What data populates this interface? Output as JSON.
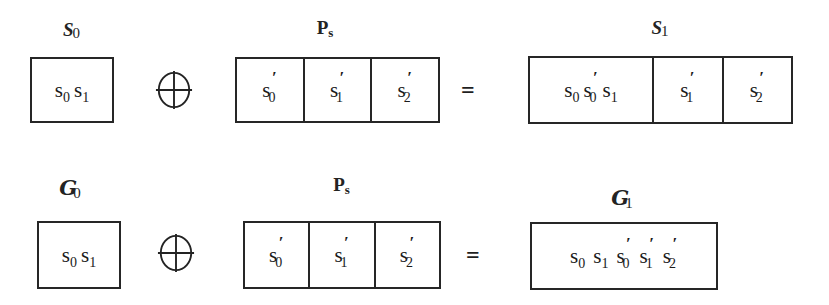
{
  "figure": {
    "background_color": "#ffffff",
    "ink_color": "#1a1a1a",
    "operators": {
      "xor": "⊕",
      "equals": "="
    }
  },
  "rows": [
    {
      "id": "row-scalar",
      "left_label": {
        "main": "S",
        "sub": "0"
      },
      "middle_label": {
        "main": "P",
        "sub": "s"
      },
      "right_label": {
        "main": "S",
        "sub": "1"
      },
      "left_box": {
        "cells": [
          {
            "tokens": [
              {
                "base": "s",
                "sub": "0",
                "prime": ""
              },
              {
                "base": "s",
                "sub": "1",
                "prime": ""
              }
            ]
          }
        ]
      },
      "middle_box": {
        "cells": [
          {
            "tokens": [
              {
                "base": "s",
                "sub": "0",
                "prime": "′"
              }
            ]
          },
          {
            "tokens": [
              {
                "base": "s",
                "sub": "1",
                "prime": "′"
              }
            ]
          },
          {
            "tokens": [
              {
                "base": "s",
                "sub": "2",
                "prime": "′"
              }
            ]
          }
        ]
      },
      "right_box": {
        "cells": [
          {
            "tokens": [
              {
                "base": "s",
                "sub": "0",
                "prime": ""
              },
              {
                "base": "s",
                "sub": "0",
                "prime": "′"
              },
              {
                "base": "s",
                "sub": "1",
                "prime": ""
              }
            ]
          },
          {
            "tokens": [
              {
                "base": "s",
                "sub": "1",
                "prime": "′"
              }
            ]
          },
          {
            "tokens": [
              {
                "base": "s",
                "sub": "2",
                "prime": "′"
              }
            ]
          }
        ]
      }
    },
    {
      "id": "row-group",
      "left_label": {
        "main": "G",
        "sub": "0"
      },
      "middle_label": {
        "main": "P",
        "sub": "s"
      },
      "right_label": {
        "main": "G",
        "sub": "1"
      },
      "left_box": {
        "cells": [
          {
            "tokens": [
              {
                "base": "s",
                "sub": "0",
                "prime": ""
              },
              {
                "base": "s",
                "sub": "1",
                "prime": ""
              }
            ]
          }
        ]
      },
      "middle_box": {
        "cells": [
          {
            "tokens": [
              {
                "base": "s",
                "sub": "0",
                "prime": "′"
              }
            ]
          },
          {
            "tokens": [
              {
                "base": "s",
                "sub": "1",
                "prime": "′"
              }
            ]
          },
          {
            "tokens": [
              {
                "base": "s",
                "sub": "2",
                "prime": "′"
              }
            ]
          }
        ]
      },
      "right_box": {
        "cells": [
          {
            "tokens": [
              {
                "base": "s",
                "sub": "0",
                "prime": ""
              },
              {
                "base": "s",
                "sub": "1",
                "prime": ""
              },
              {
                "base": "s",
                "sub": "0",
                "prime": "′"
              },
              {
                "base": "s",
                "sub": "1",
                "prime": "′"
              },
              {
                "base": "s",
                "sub": "2",
                "prime": "′"
              }
            ]
          }
        ]
      }
    }
  ]
}
